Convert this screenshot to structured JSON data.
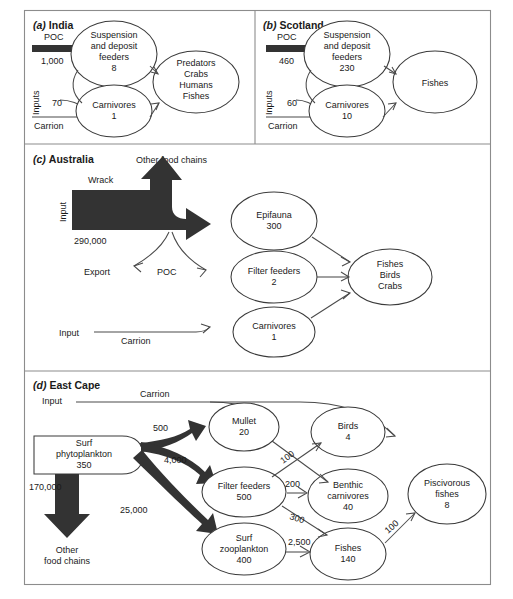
{
  "figure": {
    "background_color": "#ffffff",
    "frame_color": "#8c8c8c",
    "thick_flow_color": "#333333",
    "node_fill": "#ffffff",
    "node_stroke": "#3a3a3a"
  },
  "panels": [
    {
      "id": "a",
      "letter": "(a)",
      "name": "India",
      "inputs_label": "Inputs",
      "flows_in": [
        {
          "name": "POC",
          "value": "1,000",
          "style": "thick"
        },
        {
          "name": "",
          "value": "70",
          "style": "thin"
        },
        {
          "name": "Carrion",
          "value": "",
          "style": "thin"
        }
      ],
      "nodes": [
        {
          "id": "sdf",
          "lines": [
            "Suspension",
            "and deposit",
            "feeders",
            "8"
          ]
        },
        {
          "id": "carn",
          "lines": [
            "Carnivores",
            "1"
          ]
        },
        {
          "id": "pred",
          "lines": [
            "Predators",
            "Crabs",
            "Humans",
            "Fishes"
          ]
        }
      ],
      "links": [
        {
          "from": "poc-input",
          "to": "sdf",
          "label": ""
        },
        {
          "from": "sdf",
          "to": "carn",
          "label": ""
        },
        {
          "from": "sdf",
          "to": "pred",
          "label": ""
        },
        {
          "from": "carn",
          "to": "pred",
          "label": ""
        },
        {
          "from": "inputs-70",
          "to": "carn",
          "label": "70"
        },
        {
          "from": "carrion",
          "to": "carn",
          "label": ""
        }
      ]
    },
    {
      "id": "b",
      "letter": "(b)",
      "name": "Scotland",
      "inputs_label": "Inputs",
      "flows_in": [
        {
          "name": "POC",
          "value": "460",
          "style": "thick"
        },
        {
          "name": "",
          "value": "60",
          "style": "thin"
        },
        {
          "name": "Carrion",
          "value": "",
          "style": "thin"
        }
      ],
      "nodes": [
        {
          "id": "sdf",
          "lines": [
            "Suspension",
            "and deposit",
            "feeders",
            "230"
          ]
        },
        {
          "id": "carn",
          "lines": [
            "Carnivores",
            "10"
          ]
        },
        {
          "id": "fish",
          "lines": [
            "Fishes"
          ]
        }
      ],
      "links": [
        {
          "from": "poc-input",
          "to": "sdf",
          "label": ""
        },
        {
          "from": "sdf",
          "to": "carn",
          "label": ""
        },
        {
          "from": "sdf",
          "to": "fish",
          "label": ""
        },
        {
          "from": "carn",
          "to": "fish",
          "label": ""
        },
        {
          "from": "inputs-60",
          "to": "carn",
          "label": "60"
        },
        {
          "from": "carrion",
          "to": "carn",
          "label": ""
        }
      ]
    },
    {
      "id": "c",
      "letter": "(c)",
      "name": "Australia",
      "input_label": "Input",
      "wrack_label": "Wrack",
      "wrack_value": "290,000",
      "other_food_chains_label": "Other food chains",
      "export_label": "Export",
      "poc_label": "POC",
      "carrion_input_label": "Input",
      "carrion_label": "Carrion",
      "nodes": [
        {
          "id": "epi",
          "lines": [
            "Epifauna",
            "300"
          ]
        },
        {
          "id": "filt",
          "lines": [
            "Filter feeders",
            "2"
          ]
        },
        {
          "id": "carn",
          "lines": [
            "Carnivores",
            "1"
          ]
        },
        {
          "id": "fbc",
          "lines": [
            "Fishes",
            "Birds",
            "Crabs"
          ]
        }
      ],
      "links": [
        {
          "from": "wrack",
          "to": "other-food-chains",
          "label": ""
        },
        {
          "from": "wrack",
          "to": "epi",
          "label": ""
        },
        {
          "from": "wrack-poc",
          "to": "export",
          "label": ""
        },
        {
          "from": "wrack-poc",
          "to": "filt",
          "label": "POC"
        },
        {
          "from": "carrion-input",
          "to": "carn",
          "label": "Carrion"
        },
        {
          "from": "epi",
          "to": "fbc",
          "label": ""
        },
        {
          "from": "filt",
          "to": "fbc",
          "label": ""
        },
        {
          "from": "carn",
          "to": "fbc",
          "label": ""
        }
      ]
    },
    {
      "id": "d",
      "letter": "(d)",
      "name": "East Cape",
      "input_label": "Input",
      "carrion_label": "Carrion",
      "source": {
        "lines": [
          "Surf",
          "phytoplankton",
          "350"
        ]
      },
      "other_food_chains_label": [
        "Other",
        "food chains"
      ],
      "other_food_chains_value": "170,000",
      "nodes": [
        {
          "id": "mullet",
          "lines": [
            "Mullet",
            "20"
          ]
        },
        {
          "id": "filt",
          "lines": [
            "Filter feeders",
            "500"
          ]
        },
        {
          "id": "zoo",
          "lines": [
            "Surf",
            "zooplankton",
            "400"
          ]
        },
        {
          "id": "birds",
          "lines": [
            "Birds",
            "4"
          ]
        },
        {
          "id": "benthic",
          "lines": [
            "Benthic",
            "carnivores",
            "40"
          ]
        },
        {
          "id": "fishes",
          "lines": [
            "Fishes",
            "140"
          ]
        },
        {
          "id": "pisc",
          "lines": [
            "Piscivorous",
            "fishes",
            "8"
          ]
        }
      ],
      "links": [
        {
          "from": "surf-phytoplankton",
          "to": "mullet",
          "label": "500",
          "style": "thick"
        },
        {
          "from": "surf-phytoplankton",
          "to": "filt",
          "label": "4,000",
          "style": "thick"
        },
        {
          "from": "surf-phytoplankton",
          "to": "zoo",
          "label": "25,000",
          "style": "thick"
        },
        {
          "from": "surf-phytoplankton",
          "to": "other-food-chains",
          "label": "170,000",
          "style": "thick"
        },
        {
          "from": "carrion",
          "to": "birds",
          "label": ""
        },
        {
          "from": "carrion",
          "to": "pisc",
          "label": ""
        },
        {
          "from": "mullet",
          "to": "benthic",
          "label": ""
        },
        {
          "from": "filt",
          "to": "birds",
          "label": "100"
        },
        {
          "from": "filt",
          "to": "benthic",
          "label": "200"
        },
        {
          "from": "filt",
          "to": "fishes",
          "label": "300"
        },
        {
          "from": "zoo",
          "to": "fishes",
          "label": "2,500"
        },
        {
          "from": "fishes",
          "to": "pisc",
          "label": "100"
        }
      ]
    }
  ]
}
